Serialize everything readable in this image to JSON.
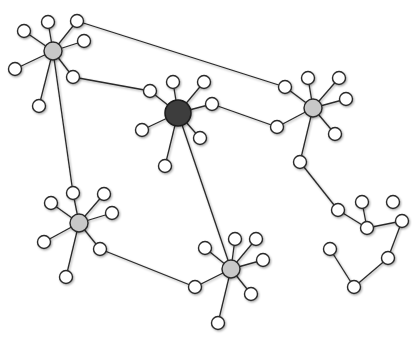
{
  "diagram": {
    "type": "network-graph",
    "colors": {
      "background": "#ffffff",
      "edge": "#2a2a2a",
      "leaf_fill": "#ffffff",
      "hub_fill": "#c8c8c8",
      "center_fill": "#3c3c3c"
    },
    "nodes": [
      {
        "id": "h1",
        "kind": "hub",
        "x": 53,
        "y": 51,
        "r": 9
      },
      {
        "id": "h1a",
        "kind": "leaf",
        "x": 24,
        "y": 31,
        "r": 6.5
      },
      {
        "id": "h1b",
        "kind": "leaf",
        "x": 48,
        "y": 22,
        "r": 6.5
      },
      {
        "id": "h1c",
        "kind": "leaf",
        "x": 77,
        "y": 21,
        "r": 6.5
      },
      {
        "id": "h1d",
        "kind": "leaf",
        "x": 84,
        "y": 41,
        "r": 6.5
      },
      {
        "id": "h1e",
        "kind": "leaf",
        "x": 15,
        "y": 69,
        "r": 6.5
      },
      {
        "id": "h1f",
        "kind": "leaf",
        "x": 73,
        "y": 77,
        "r": 6.5
      },
      {
        "id": "h1g",
        "kind": "leaf",
        "x": 39,
        "y": 106,
        "r": 6.5
      },
      {
        "id": "c",
        "kind": "center",
        "x": 178,
        "y": 113,
        "r": 13
      },
      {
        "id": "ca",
        "kind": "leaf",
        "x": 150,
        "y": 91,
        "r": 6.5
      },
      {
        "id": "cb",
        "kind": "leaf",
        "x": 173,
        "y": 82,
        "r": 6.5
      },
      {
        "id": "cc",
        "kind": "leaf",
        "x": 204,
        "y": 82,
        "r": 6.5
      },
      {
        "id": "cd",
        "kind": "leaf",
        "x": 212,
        "y": 104,
        "r": 6.5
      },
      {
        "id": "ce",
        "kind": "leaf",
        "x": 142,
        "y": 130,
        "r": 6.5
      },
      {
        "id": "cf",
        "kind": "leaf",
        "x": 200,
        "y": 138,
        "r": 6.5
      },
      {
        "id": "cg",
        "kind": "leaf",
        "x": 165,
        "y": 166,
        "r": 6.5
      },
      {
        "id": "h2",
        "kind": "hub",
        "x": 313,
        "y": 108,
        "r": 9
      },
      {
        "id": "h2a",
        "kind": "leaf",
        "x": 285,
        "y": 87,
        "r": 6.5
      },
      {
        "id": "h2b",
        "kind": "leaf",
        "x": 308,
        "y": 78,
        "r": 6.5
      },
      {
        "id": "h2c",
        "kind": "leaf",
        "x": 339,
        "y": 78,
        "r": 6.5
      },
      {
        "id": "h2d",
        "kind": "leaf",
        "x": 346,
        "y": 99,
        "r": 6.5
      },
      {
        "id": "h2e",
        "kind": "leaf",
        "x": 277,
        "y": 127,
        "r": 6.5
      },
      {
        "id": "h2f",
        "kind": "leaf",
        "x": 335,
        "y": 134,
        "r": 6.5
      },
      {
        "id": "h2g",
        "kind": "leaf",
        "x": 300,
        "y": 162,
        "r": 6.5
      },
      {
        "id": "h3",
        "kind": "hub",
        "x": 79,
        "y": 223,
        "r": 9
      },
      {
        "id": "h3a",
        "kind": "leaf",
        "x": 73,
        "y": 193,
        "r": 6.5
      },
      {
        "id": "h3b",
        "kind": "leaf",
        "x": 51,
        "y": 203,
        "r": 6.5
      },
      {
        "id": "h3c",
        "kind": "leaf",
        "x": 104,
        "y": 194,
        "r": 6.5
      },
      {
        "id": "h3d",
        "kind": "leaf",
        "x": 112,
        "y": 213,
        "r": 6.5
      },
      {
        "id": "h3e",
        "kind": "leaf",
        "x": 44,
        "y": 242,
        "r": 6.5
      },
      {
        "id": "h3f",
        "kind": "leaf",
        "x": 100,
        "y": 249,
        "r": 6.5
      },
      {
        "id": "h3g",
        "kind": "leaf",
        "x": 66,
        "y": 277,
        "r": 6.5
      },
      {
        "id": "h4",
        "kind": "hub",
        "x": 231,
        "y": 269,
        "r": 9
      },
      {
        "id": "h4a",
        "kind": "leaf",
        "x": 205,
        "y": 248,
        "r": 6.5
      },
      {
        "id": "h4b",
        "kind": "leaf",
        "x": 235,
        "y": 239,
        "r": 6.5
      },
      {
        "id": "h4c",
        "kind": "leaf",
        "x": 256,
        "y": 239,
        "r": 6.5
      },
      {
        "id": "h4d",
        "kind": "leaf",
        "x": 263,
        "y": 260,
        "r": 6.5
      },
      {
        "id": "h4e",
        "kind": "leaf",
        "x": 195,
        "y": 287,
        "r": 6.5
      },
      {
        "id": "h4f",
        "kind": "leaf",
        "x": 251,
        "y": 294,
        "r": 6.5
      },
      {
        "id": "h4g",
        "kind": "leaf",
        "x": 218,
        "y": 323,
        "r": 6.5
      },
      {
        "id": "p1",
        "kind": "leaf",
        "x": 338,
        "y": 210,
        "r": 6.5
      },
      {
        "id": "p2",
        "kind": "leaf",
        "x": 362,
        "y": 202,
        "r": 6.5
      },
      {
        "id": "p3",
        "kind": "leaf",
        "x": 393,
        "y": 202,
        "r": 6.5
      },
      {
        "id": "p4",
        "kind": "leaf",
        "x": 367,
        "y": 228,
        "r": 6.5
      },
      {
        "id": "p5",
        "kind": "leaf",
        "x": 402,
        "y": 221,
        "r": 6.5
      },
      {
        "id": "p6",
        "kind": "leaf",
        "x": 388,
        "y": 258,
        "r": 6.5
      },
      {
        "id": "p7",
        "kind": "leaf",
        "x": 354,
        "y": 287,
        "r": 6.5
      },
      {
        "id": "p8",
        "kind": "leaf",
        "x": 330,
        "y": 249,
        "r": 6.5
      }
    ],
    "edges": [
      [
        "h1",
        "h1a"
      ],
      [
        "h1",
        "h1b"
      ],
      [
        "h1",
        "h1c"
      ],
      [
        "h1",
        "h1d"
      ],
      [
        "h1",
        "h1e"
      ],
      [
        "h1",
        "h1f"
      ],
      [
        "h1",
        "h1g"
      ],
      [
        "c",
        "ca"
      ],
      [
        "c",
        "cb"
      ],
      [
        "c",
        "cc"
      ],
      [
        "c",
        "cd"
      ],
      [
        "c",
        "ce"
      ],
      [
        "c",
        "cf"
      ],
      [
        "c",
        "cg"
      ],
      [
        "h2",
        "h2a"
      ],
      [
        "h2",
        "h2b"
      ],
      [
        "h2",
        "h2c"
      ],
      [
        "h2",
        "h2d"
      ],
      [
        "h2",
        "h2e"
      ],
      [
        "h2",
        "h2f"
      ],
      [
        "h2",
        "h2g"
      ],
      [
        "h3",
        "h3a"
      ],
      [
        "h3",
        "h3b"
      ],
      [
        "h3",
        "h3c"
      ],
      [
        "h3",
        "h3d"
      ],
      [
        "h3",
        "h3e"
      ],
      [
        "h3",
        "h3f"
      ],
      [
        "h3",
        "h3g"
      ],
      [
        "h4",
        "h4a"
      ],
      [
        "h4",
        "h4b"
      ],
      [
        "h4",
        "h4c"
      ],
      [
        "h4",
        "h4d"
      ],
      [
        "h4",
        "h4e"
      ],
      [
        "h4",
        "h4f"
      ],
      [
        "h4",
        "h4g"
      ],
      [
        "h1c",
        "h2a"
      ],
      [
        "h1f",
        "ca"
      ],
      [
        "cd",
        "h2e"
      ],
      [
        "h1",
        "h3a"
      ],
      [
        "c",
        "h4"
      ],
      [
        "h3f",
        "h4e"
      ],
      [
        "h2g",
        "p1"
      ],
      [
        "p1",
        "p4"
      ],
      [
        "p2",
        "p4"
      ],
      [
        "p2",
        "p3"
      ],
      [
        "p4",
        "p5"
      ],
      [
        "p5",
        "p6"
      ],
      [
        "p6",
        "p7"
      ],
      [
        "p7",
        "p8"
      ]
    ]
  }
}
